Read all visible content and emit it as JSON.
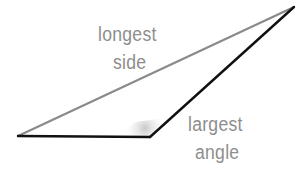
{
  "diagram": {
    "type": "triangle",
    "vertices": {
      "left": [
        18,
        136
      ],
      "obtuse": [
        150,
        137
      ],
      "top": [
        294,
        7
      ]
    },
    "colors": {
      "longest_side": "#8a8a8a",
      "other_sides": "#111111",
      "label": "#8e8e8e",
      "angle_shade": "#bdbdbd"
    },
    "labels": {
      "side_line1": "longest",
      "side_line2": "side",
      "angle_line1": "largest",
      "angle_line2": "angle"
    }
  }
}
